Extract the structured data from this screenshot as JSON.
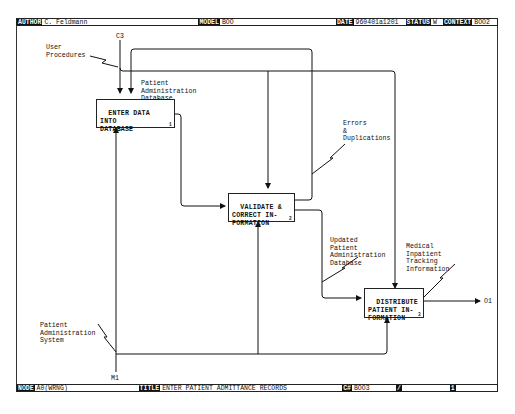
{
  "header": {
    "author_label": "AUTHOR",
    "author": "C. Feldmann",
    "model_label": "MODEL",
    "model": "BOO",
    "date_label": "DATE",
    "date": "960401a1201",
    "status_label": "STATUS",
    "status": "W",
    "context_label": "CONTEXT",
    "context": "BOO2"
  },
  "footer": {
    "node_label": "NODE",
    "node": "A0(WRNG)",
    "title_label": "TITLE",
    "title": "ENTER PATIENT ADMITTANCE RECORDS",
    "c_label": "C#",
    "c_number": "BOO3",
    "mark1": "/",
    "mark2": "1"
  },
  "activities": [
    {
      "id": "A1",
      "text": "ENTER DATA\nINTO\nDATABASE",
      "number": "1"
    },
    {
      "id": "A2",
      "text": "VALIDATE &\nCORRECT IN-\nFORMATION",
      "number": "2"
    },
    {
      "id": "A3",
      "text": "DISTRIBUTE\nPATIENT IN-\nFORMATION",
      "number": "3"
    }
  ],
  "arrow_labels": {
    "user_procedures": "User\nProcedures",
    "c3": "C3",
    "patient_admin_db": "Patient\nAdministration\nDatabase",
    "errors_duplications": "Errors\n&\nDuplications",
    "updated_db": "Updated\nPatient\nAdministration\nDatabase",
    "medical_tracking": "Medical\nInpatient\nTracking\nInformation",
    "patient_admin_system": "Patient\nAdministration\nSystem",
    "m1": "M1",
    "o1": "O1"
  }
}
